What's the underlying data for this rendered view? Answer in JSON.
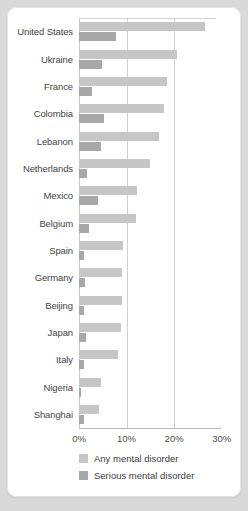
{
  "chart_data": {
    "type": "bar",
    "orientation": "horizontal",
    "title": "",
    "xlabel": "",
    "ylabel": "",
    "xlim": [
      0,
      28.8
    ],
    "grid": true,
    "gridlines_at": [
      10,
      20
    ],
    "legend_position": "bottom-left",
    "tick_labels": [
      "0%",
      "10%",
      "20%",
      "30%"
    ],
    "tick_values": [
      0,
      10,
      20,
      30
    ],
    "categories": [
      "United States",
      "Ukraine",
      "France",
      "Colombia",
      "Lebanon",
      "Netherlands",
      "Mexico",
      "Belgium",
      "Spain",
      "Germany",
      "Beijing",
      "Japan",
      "Italy",
      "Nigeria",
      "Shanghai"
    ],
    "series": [
      {
        "name": "Any mental disorder",
        "color": "#c6c6c6",
        "values": [
          26.4,
          20.5,
          18.4,
          17.8,
          16.9,
          14.9,
          12.2,
          12.0,
          9.2,
          9.1,
          9.1,
          8.8,
          8.2,
          4.7,
          4.3
        ]
      },
      {
        "name": "Serious mental disorder",
        "color": "#a8a8a8",
        "values": [
          7.7,
          4.8,
          2.7,
          5.2,
          4.6,
          1.6,
          3.9,
          2.0,
          1.0,
          1.2,
          1.1,
          1.5,
          1.0,
          0.4,
          1.1
        ]
      }
    ]
  },
  "legend": {
    "items": [
      {
        "label": "Any mental disorder",
        "color": "#c6c6c6"
      },
      {
        "label": "Serious mental disorder",
        "color": "#a8a8a8"
      }
    ]
  }
}
